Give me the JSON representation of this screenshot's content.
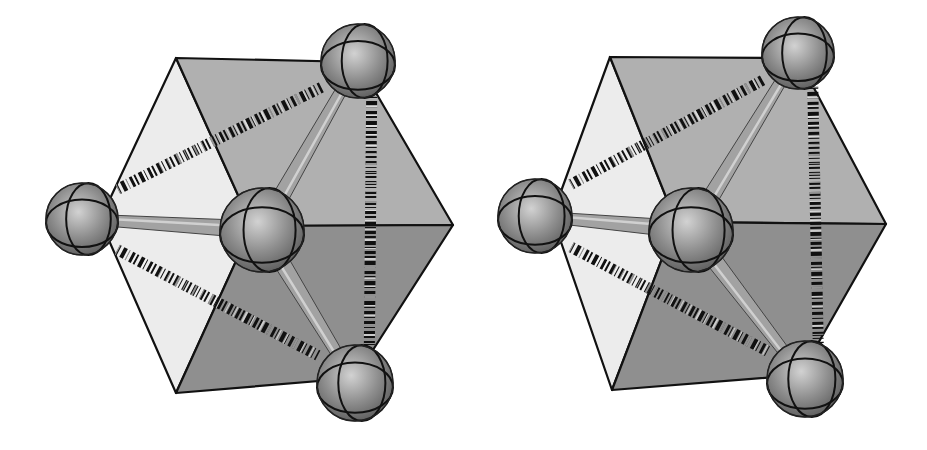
{
  "figure": {
    "panels": [
      {
        "id": "left",
        "cube": {
          "vertices": {
            "tl": [
              176,
              58
            ],
            "tr": [
              358,
              62
            ],
            "r": [
              453,
              225
            ],
            "br": [
              355,
              378
            ],
            "bl": [
              176,
              393
            ],
            "l": [
              100,
              220
            ],
            "c": [
              252,
              226
            ]
          }
        },
        "central_atom": {
          "cx": 262,
          "cy": 230,
          "r": 42
        },
        "outer_atoms": [
          {
            "name": "left",
            "cx": 82,
            "cy": 219,
            "r": 36
          },
          {
            "name": "top-right",
            "cx": 358,
            "cy": 61,
            "r": 37
          },
          {
            "name": "bottom-right",
            "cx": 355,
            "cy": 383,
            "r": 38
          }
        ],
        "hidden_atom_direction": [
          453,
          225
        ]
      },
      {
        "id": "right",
        "cube": {
          "vertices": {
            "tl": [
              610,
              57
            ],
            "tr": [
              798,
              58
            ],
            "r": [
              886,
              224
            ],
            "br": [
              800,
              375
            ],
            "bl": [
              612,
              390
            ],
            "l": [
              552,
              216
            ],
            "c": [
              676,
              222
            ]
          }
        },
        "central_atom": {
          "cx": 691,
          "cy": 230,
          "r": 42
        },
        "outer_atoms": [
          {
            "name": "left",
            "cx": 535,
            "cy": 216,
            "r": 37
          },
          {
            "name": "top-right",
            "cx": 798,
            "cy": 53,
            "r": 36
          },
          {
            "name": "bottom-right",
            "cx": 805,
            "cy": 379,
            "r": 38
          }
        ],
        "hidden_atom_direction": [
          886,
          224
        ]
      }
    ],
    "colors": {
      "face_light": "#ececec",
      "face_upper": "#b0b0b0",
      "face_lower": "#8f8f8f",
      "edge": "#111111",
      "atom": "#8a8a8a",
      "atom_highlight": "#cfcfcf",
      "bond": "#9a9a9a",
      "hatch": "#111111"
    }
  }
}
